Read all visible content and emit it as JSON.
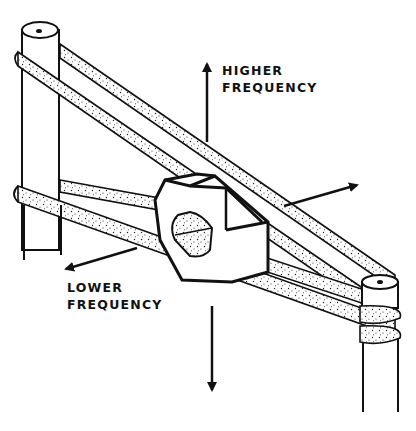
{
  "diagram": {
    "style": "black-and-white technical line drawing",
    "labels": {
      "higher": {
        "line1": "HIGHER",
        "line2": "FREQUENCY"
      },
      "lower": {
        "line1": "LOWER",
        "line2": "FREQUENCY"
      }
    },
    "arrows": [
      {
        "name": "up-arrow",
        "direction": "up",
        "meaning": "higher frequency"
      },
      {
        "name": "right-arrow",
        "direction": "up-right"
      },
      {
        "name": "down-arrow",
        "direction": "down"
      },
      {
        "name": "left-arrow",
        "direction": "down-left",
        "meaning": "lower frequency"
      }
    ],
    "colors": {
      "ink": "#111111",
      "background": "#ffffff"
    }
  }
}
